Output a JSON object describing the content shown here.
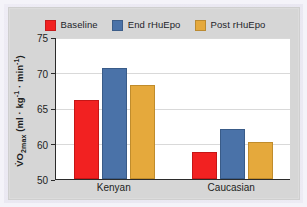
{
  "figure": {
    "panel_bg": "#d6d6d6",
    "plot_bg": "#ffffff",
    "outer_bg": "#eceaf4"
  },
  "chart_data": {
    "type": "bar",
    "title": "",
    "xlabel": "",
    "ylabel": "VO2max (ml · kg-1 · min-1)",
    "ylabel_main": "O",
    "ylabel_sub": "2max",
    "ylabel_prefix": "V̇",
    "ylabel_units": " (ml · kg",
    "ylabel_exp1": "-1",
    "ylabel_mid": " · min",
    "ylabel_exp2": "-1",
    "ylabel_suffix": ")",
    "categories": [
      "Kenyan",
      "Caucasian"
    ],
    "ylim": [
      50,
      75
    ],
    "yticks": [
      50,
      60,
      65,
      70,
      75
    ],
    "ytick_labels": [
      "50",
      "60",
      "65",
      "70",
      "75"
    ],
    "grid": true,
    "legend_position": "top-center",
    "series": [
      {
        "name": "Baseline",
        "color": "#f22121",
        "values": [
          66.1,
          57.5
        ]
      },
      {
        "name": "End rHuEpo",
        "color": "#4a72a8",
        "values": [
          70.6,
          62.0
        ]
      },
      {
        "name": "Post rHuEpo",
        "color": "#e5a93c",
        "values": [
          68.2,
          60.2
        ]
      }
    ]
  }
}
